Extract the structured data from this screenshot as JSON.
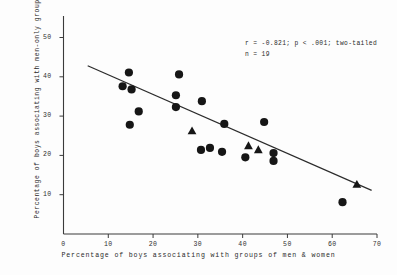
{
  "chart_data": {
    "type": "scatter",
    "title": "",
    "xlabel": "Percentage of boys associating with groups of men & women",
    "ylabel": "Percentage of boys associating with men-only groups",
    "xlim": [
      0,
      70
    ],
    "ylim": [
      0,
      50
    ],
    "xticks": [
      0,
      10,
      20,
      30,
      40,
      50,
      60,
      70
    ],
    "yticks": [
      10,
      20,
      30,
      40,
      50
    ],
    "grid": false,
    "legend": "none",
    "annotations": [
      "r = -0.821; p < .001; two-tailed",
      "n = 19"
    ],
    "series": [
      {
        "name": "circles",
        "marker": "circle",
        "points": [
          {
            "x": 14.6,
            "y": 41.1
          },
          {
            "x": 13.2,
            "y": 37.6
          },
          {
            "x": 15.2,
            "y": 36.8
          },
          {
            "x": 16.8,
            "y": 31.2
          },
          {
            "x": 14.8,
            "y": 27.8
          },
          {
            "x": 25.8,
            "y": 40.6
          },
          {
            "x": 25.1,
            "y": 35.3
          },
          {
            "x": 30.9,
            "y": 33.8
          },
          {
            "x": 25.1,
            "y": 32.3
          },
          {
            "x": 35.9,
            "y": 28.0
          },
          {
            "x": 30.7,
            "y": 21.4
          },
          {
            "x": 32.7,
            "y": 21.9
          },
          {
            "x": 35.4,
            "y": 20.9
          },
          {
            "x": 44.8,
            "y": 28.5
          },
          {
            "x": 40.6,
            "y": 19.5
          },
          {
            "x": 46.9,
            "y": 20.6
          },
          {
            "x": 46.9,
            "y": 18.6
          },
          {
            "x": 62.3,
            "y": 8.1
          }
        ]
      },
      {
        "name": "triangles",
        "marker": "triangle",
        "points": [
          {
            "x": 28.7,
            "y": 26.2
          },
          {
            "x": 41.3,
            "y": 22.4
          },
          {
            "x": 43.5,
            "y": 21.4
          },
          {
            "x": 65.5,
            "y": 12.6
          }
        ]
      }
    ],
    "regression_line": {
      "x_start": 5.4,
      "y_start": 42.8,
      "x_end": 68.8,
      "y_end": 11.1
    }
  },
  "axis": {
    "x_tick_labels": [
      "0",
      "10",
      "20",
      "30",
      "40",
      "50",
      "60",
      "70"
    ],
    "y_tick_labels": [
      "10",
      "20",
      "30",
      "40",
      "50"
    ]
  }
}
